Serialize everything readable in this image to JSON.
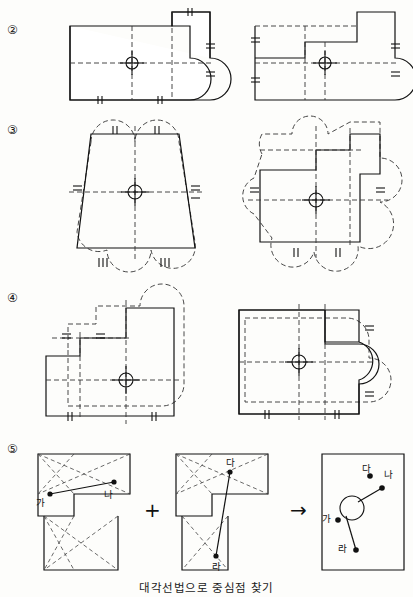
{
  "page": {
    "caption": "대각선법으로 중심점 찾기",
    "width": 413,
    "height": 597
  },
  "rows": [
    {
      "id": "row-2",
      "label": "②"
    },
    {
      "id": "row-3",
      "label": "③"
    },
    {
      "id": "row-4",
      "label": "④"
    },
    {
      "id": "row-5",
      "label": "⑤"
    }
  ],
  "row5": {
    "plus_symbol": "+",
    "arrow_symbol": "→",
    "left_figure_labels": [
      {
        "text": "가"
      },
      {
        "text": "나"
      }
    ],
    "middle_figure_labels": [
      {
        "text": "다"
      },
      {
        "text": "라"
      }
    ],
    "right_figure_labels": [
      {
        "text": "다"
      },
      {
        "text": "나"
      },
      {
        "text": "가"
      },
      {
        "text": "라"
      }
    ]
  },
  "colors": {
    "line": "#111111",
    "dashed": "#333333",
    "paper": "#fdfdfb"
  }
}
